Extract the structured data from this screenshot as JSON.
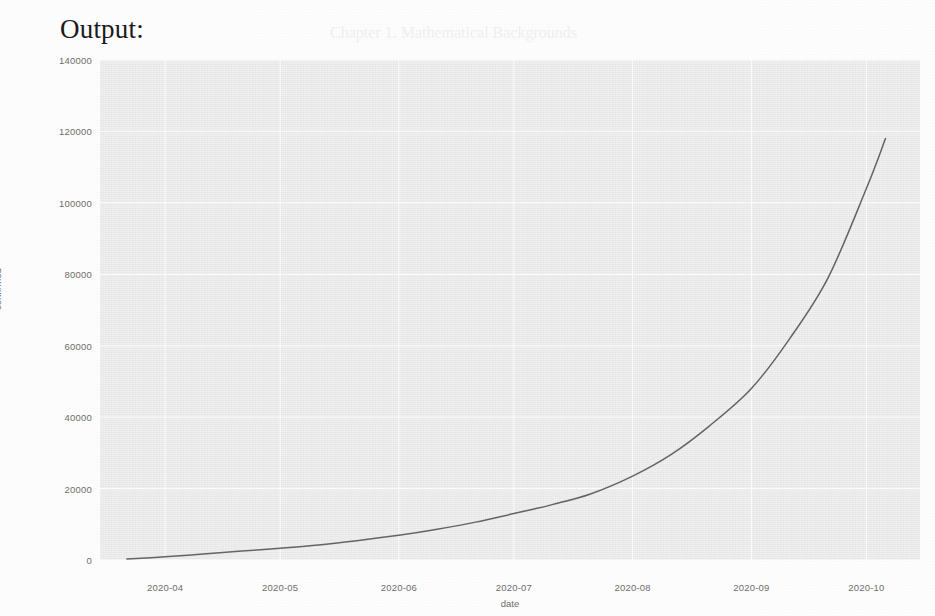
{
  "caption": "Output:",
  "background_document": {
    "headings": [
      "1.5.2   Notion of Bicoordinates",
      "1.5.2   Intra-mixture Data Exchange"
    ],
    "lines": [
      "Chapter 1. Mathematical Backgrounds",
      "distribution of one unit. The 1st form of a record, been transformed into the",
      "equivalent of the base units to calculate the bi-target mixture exchanges.",
      "A first note: an arrangement of the coefficient support a mixture into a unit",
      "of the vector, which codes to a merge operator, and mean that the parameters",
      "and a measure of the data flow of families and parametric schedule.",
      "Here, consider the guide for proper systems in a bicoordinate,",
      "such that all components of a given mixture are the relative weights, then",
      "the cardinal increase from a mixture exchange leading the similarity state."
    ]
  },
  "chart_data": {
    "type": "line",
    "title": "",
    "xlabel": "date",
    "ylabel": "confirmed",
    "grid": true,
    "legend": "none",
    "style": "seaborn-darkgrid",
    "line_color": "#4c4c4c",
    "plot_background": "#eaeaea",
    "gridline_color": "#ffffff",
    "xtick_labels": [
      "2020-04",
      "2020-05",
      "2020-06",
      "2020-07",
      "2020-08",
      "2020-09",
      "2020-10"
    ],
    "ytick_labels": [
      "0",
      "20000",
      "40000",
      "60000",
      "80000",
      "100000",
      "120000",
      "140000"
    ],
    "ylim": [
      0,
      140000
    ],
    "xlim": [
      "2020-03-15",
      "2020-10-15"
    ],
    "x": [
      "2020-03-22",
      "2020-04-01",
      "2020-04-11",
      "2020-04-21",
      "2020-05-01",
      "2020-05-11",
      "2020-05-21",
      "2020-06-01",
      "2020-06-11",
      "2020-06-21",
      "2020-07-01",
      "2020-07-06",
      "2020-07-11",
      "2020-07-21",
      "2020-08-01",
      "2020-08-11",
      "2020-08-21",
      "2020-09-01",
      "2020-09-11",
      "2020-09-21",
      "2020-10-01",
      "2020-10-06"
    ],
    "y": [
      300,
      900,
      1700,
      2500,
      3300,
      4200,
      5400,
      6900,
      8600,
      10600,
      13000,
      14200,
      15500,
      18500,
      23500,
      29500,
      37500,
      48000,
      62000,
      79000,
      104000,
      118000
    ],
    "y_final": 136000,
    "annotations": []
  }
}
